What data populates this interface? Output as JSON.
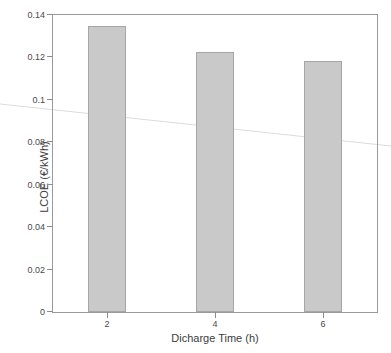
{
  "chart_data": {
    "type": "bar",
    "title": "",
    "xlabel": "Dicharge Time (h)",
    "ylabel": "LCOE (€/kWh)",
    "categories": [
      "2",
      "4",
      "6"
    ],
    "values": [
      0.135,
      0.1227,
      0.1185
    ],
    "x": [
      2,
      4,
      6
    ],
    "xlim": [
      1,
      7
    ],
    "ylim": [
      0,
      0.14
    ],
    "yticks": [
      "0",
      "0.02",
      "0.04",
      "0.06",
      "0.08",
      "0.1",
      "0.12",
      "0.14"
    ],
    "ytick_values": [
      0,
      0.02,
      0.04,
      0.06,
      0.08,
      0.1,
      0.12,
      0.14
    ],
    "xticks": [
      "2",
      "4",
      "6"
    ],
    "grid": false,
    "legend": null,
    "series": [
      {
        "name": "LCOE",
        "values": [
          0.135,
          0.1227,
          0.1185
        ]
      }
    ],
    "bar_color": "#c9c9c9",
    "bar_edge_color": "#a6a6a6",
    "axis_color": "#9a9a9a",
    "background": "#ffffff"
  },
  "figure": {
    "y_axis_title": "LCOE (€/kWh)",
    "x_axis_title": "Dicharge Time (h)"
  }
}
